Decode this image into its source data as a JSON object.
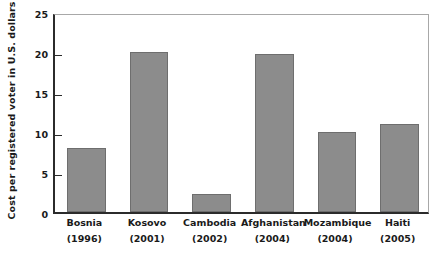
{
  "chart_data": {
    "type": "bar",
    "title": "",
    "xlabel": "",
    "ylabel": "Cost per registered voter in U.S. dollars",
    "ylim": [
      0,
      25
    ],
    "yticks": [
      0,
      5,
      10,
      15,
      20,
      25
    ],
    "ytick_labels": [
      "0",
      "5",
      "10",
      "15",
      "20",
      "25"
    ],
    "grid": false,
    "legend": null,
    "categories": [
      "Bosnia",
      "Kosovo",
      "Cambodia",
      "Afghanistan",
      "Mozambique",
      "Haiti"
    ],
    "category_years": [
      "(1996)",
      "(2001)",
      "(2002)",
      "(2004)",
      "(2004)",
      "(2005)"
    ],
    "values": [
      8,
      20,
      2.2,
      19.8,
      10,
      11
    ],
    "bar_color": "#8c8c8c",
    "bar_edge_color": "#6e6e6e",
    "axis_color": "#2b2b2b",
    "frame_color": "#a8a8a8"
  }
}
